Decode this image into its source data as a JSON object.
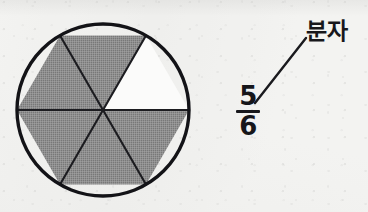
{
  "figure": {
    "kind": "fraction-pie-diagram",
    "background_color": "#f3f3f1",
    "ink_color": "#18181c"
  },
  "pie": {
    "total_parts": 6,
    "shaded_parts": 5,
    "unshaded_parts": 1,
    "shaded_fill_color": "#8a8a8a",
    "unshaded_fill_color": "#fbfbfa",
    "outline_color": "#18181c",
    "center_x": 90,
    "center_y": 90,
    "radius": 86,
    "sector_span_degrees": 60,
    "sectors": [
      {
        "index": 1,
        "start_deg": 0,
        "end_deg": 60,
        "state": "unshaded"
      },
      {
        "index": 2,
        "start_deg": 60,
        "end_deg": 120,
        "state": "shaded"
      },
      {
        "index": 3,
        "start_deg": 120,
        "end_deg": 180,
        "state": "shaded"
      },
      {
        "index": 4,
        "start_deg": 180,
        "end_deg": 240,
        "state": "shaded"
      },
      {
        "index": 5,
        "start_deg": 240,
        "end_deg": 300,
        "state": "shaded"
      },
      {
        "index": 6,
        "start_deg": 300,
        "end_deg": 360,
        "state": "shaded"
      }
    ]
  },
  "fraction": {
    "numerator": "5",
    "denominator": "6",
    "value_text": "5/6"
  },
  "callout": {
    "label": "분자",
    "meaning": "numerator",
    "leader_line": {
      "x1": 255,
      "y1": 103,
      "x2": 306,
      "y2": 38
    }
  }
}
